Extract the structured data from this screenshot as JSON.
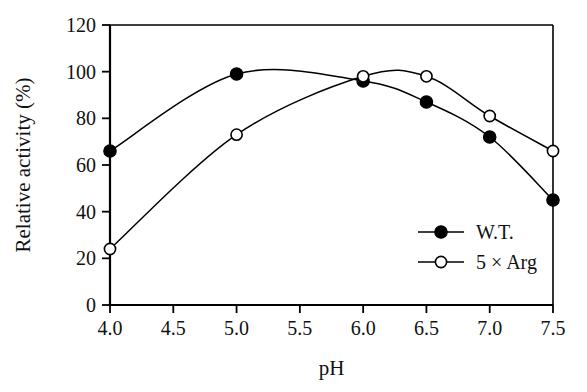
{
  "chart_data": {
    "type": "line",
    "title": "",
    "xlabel": "pH",
    "ylabel": "Relative activity (%)",
    "xlim": [
      4.0,
      7.5
    ],
    "ylim": [
      0,
      120
    ],
    "grid": false,
    "legend_position": "bottom-right",
    "x": [
      4.0,
      5.0,
      6.0,
      6.5,
      7.0,
      7.5
    ],
    "xticks": [
      "4.0",
      "4.5",
      "5.0",
      "5.5",
      "6.0",
      "6.5",
      "7.0",
      "7.5"
    ],
    "xtick_values": [
      4.0,
      4.5,
      5.0,
      5.5,
      6.0,
      6.5,
      7.0,
      7.5
    ],
    "yticks": [
      "0",
      "20",
      "40",
      "60",
      "80",
      "100",
      "120"
    ],
    "ytick_values": [
      0,
      20,
      40,
      60,
      80,
      100,
      120
    ],
    "series": [
      {
        "name": "W.T.",
        "marker": "filled-circle",
        "x": [
          4.0,
          5.0,
          6.0,
          6.5,
          7.0,
          7.5
        ],
        "values": [
          66,
          99,
          96,
          87,
          72,
          45
        ]
      },
      {
        "name": "5 × Arg",
        "marker": "open-circle",
        "x": [
          4.0,
          5.0,
          6.0,
          6.5,
          7.0,
          7.5
        ],
        "values": [
          24,
          73,
          98,
          98,
          81,
          66
        ]
      }
    ]
  },
  "legend": {
    "entries": [
      {
        "label": "W.T."
      },
      {
        "label": "5 × Arg"
      }
    ]
  },
  "colors": {
    "axis": "#000000",
    "series_wt": "#000000",
    "series_arg": "#000000",
    "background": "#ffffff"
  }
}
